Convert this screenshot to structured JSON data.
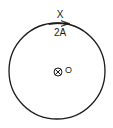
{
  "diagram": {
    "type": "circular current loop",
    "labels": {
      "point_top": "X",
      "current": "2A",
      "center": "O"
    },
    "center_symbol": "into-page (⊗)",
    "current_direction": "clockwise (arrow at top pointing right)",
    "colors": {
      "stroke": "#1a1a1a",
      "background": "#ffffff"
    }
  }
}
